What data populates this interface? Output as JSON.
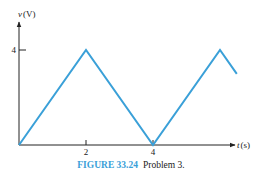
{
  "chart_data": {
    "type": "line",
    "title": "",
    "xlabel": "t (s)",
    "ylabel": "v (V)",
    "x_var": "t",
    "x_unit": "(s)",
    "y_var": "v",
    "y_unit": "(V)",
    "xlim": [
      0,
      7
    ],
    "ylim": [
      0,
      5
    ],
    "x_ticks": [
      2,
      4
    ],
    "x_tick_labels": [
      "2",
      "4"
    ],
    "y_ticks": [
      4
    ],
    "y_tick_labels": [
      "4"
    ],
    "grid": false,
    "series": [
      {
        "name": "v(t)",
        "color": "#3aa0d8",
        "x": [
          0,
          2,
          4,
          6,
          6.5
        ],
        "y": [
          0,
          4,
          0,
          4,
          3
        ]
      }
    ]
  },
  "caption": {
    "figure_number": "FIGURE 33.24",
    "text": "Problem 3."
  },
  "colors": {
    "series": "#3aa0d8",
    "axis": "#222222",
    "caption_accent": "#3aa0d8"
  }
}
